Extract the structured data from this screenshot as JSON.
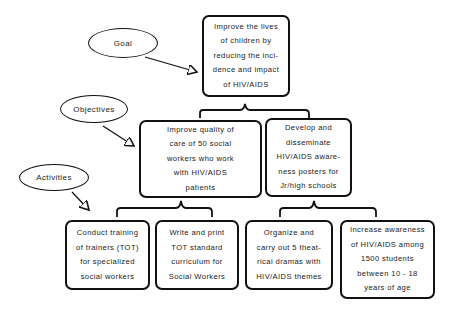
{
  "labels": {
    "goal": "Goal",
    "objectives": "Objectives",
    "activities": "Activities"
  },
  "goal": {
    "text": "Improve the lives\nof children by\nreducing the inci-\ndence and impact\nof HIV/AIDS"
  },
  "objectives": [
    {
      "text": "Improve quality of\ncare of 50 social\nworkers who work\nwith HIV/AIDS\npatients"
    },
    {
      "text": "Develop and\ndisseminate\nHIV/AIDS aware-\nness posters for\nJr/high schools"
    }
  ],
  "activities": [
    {
      "text": "Conduct training\nof trainers (TOT)\nfor specialized\nsocial workers"
    },
    {
      "text": "Write and print\nTOT standard\ncurriculum for\nSocial Workers"
    },
    {
      "text": "Organize and\ncarry out 5 theat-\nrical dramas with\nHIV/AIDS themes"
    },
    {
      "text": "Increase awareness\nof HIV/AIDS among\n1500 students\nbetween 10 - 18\nyears of age"
    }
  ]
}
